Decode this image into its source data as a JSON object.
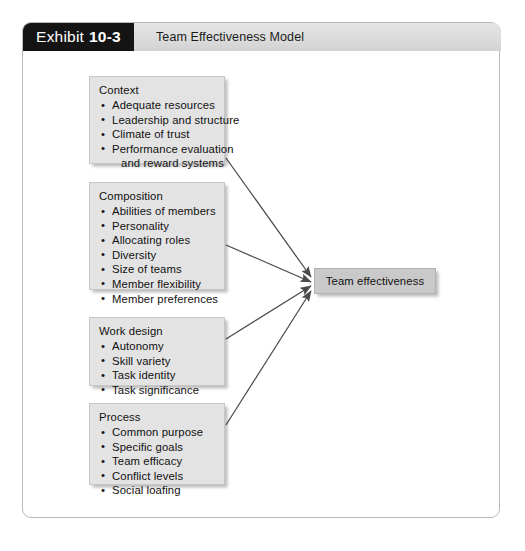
{
  "exhibit": {
    "tag_word": "Exhibit",
    "tag_number": "10-3",
    "title": "Team Effectiveness Model"
  },
  "colors": {
    "tag_background": "#141414",
    "title_bar_background": "#dcdcdc",
    "factor_box_background": "#e3e3e3",
    "outcome_box_background": "#c9c9c9",
    "arrow_stroke": "#4a4a4a",
    "frame_border": "#b9b9b9"
  },
  "diagram": {
    "type": "concept-model",
    "factors": [
      {
        "id": "context",
        "title": "Context",
        "items": [
          {
            "text": "Adequate resources",
            "continuation": false
          },
          {
            "text": "Leadership and structure",
            "continuation": false
          },
          {
            "text": "Climate of trust",
            "continuation": false
          },
          {
            "text": "Performance evaluation",
            "continuation": false
          },
          {
            "text": "and reward systems",
            "continuation": true
          }
        ]
      },
      {
        "id": "composition",
        "title": "Composition",
        "items": [
          {
            "text": "Abilities of members",
            "continuation": false
          },
          {
            "text": "Personality",
            "continuation": false
          },
          {
            "text": "Allocating roles",
            "continuation": false
          },
          {
            "text": "Diversity",
            "continuation": false
          },
          {
            "text": "Size of teams",
            "continuation": false
          },
          {
            "text": "Member flexibility",
            "continuation": false
          },
          {
            "text": "Member preferences",
            "continuation": false
          }
        ]
      },
      {
        "id": "work-design",
        "title": "Work design",
        "items": [
          {
            "text": "Autonomy",
            "continuation": false
          },
          {
            "text": "Skill variety",
            "continuation": false
          },
          {
            "text": "Task identity",
            "continuation": false
          },
          {
            "text": "Task significance",
            "continuation": false
          }
        ]
      },
      {
        "id": "process",
        "title": "Process",
        "items": [
          {
            "text": "Common purpose",
            "continuation": false
          },
          {
            "text": "Specific goals",
            "continuation": false
          },
          {
            "text": "Team efficacy",
            "continuation": false
          },
          {
            "text": "Conflict levels",
            "continuation": false
          },
          {
            "text": "Social loafing",
            "continuation": false
          }
        ]
      }
    ],
    "outcome": {
      "id": "team-effectiveness",
      "label": "Team effectiveness"
    },
    "arrows": [
      {
        "from": "context",
        "to": "team-effectiveness"
      },
      {
        "from": "composition",
        "to": "team-effectiveness"
      },
      {
        "from": "work-design",
        "to": "team-effectiveness"
      },
      {
        "from": "process",
        "to": "team-effectiveness"
      }
    ]
  },
  "layout": {
    "factor_boxes": [
      {
        "id": "context",
        "left": 66,
        "top": 25,
        "width": 136,
        "height": 88
      },
      {
        "id": "composition",
        "left": 66,
        "top": 131,
        "width": 136,
        "height": 108
      },
      {
        "id": "work-design",
        "left": 66,
        "top": 266,
        "width": 136,
        "height": 69
      },
      {
        "id": "process",
        "left": 66,
        "top": 352,
        "width": 136,
        "height": 82
      }
    ],
    "arrow_paths": [
      {
        "id": "arrow-context",
        "x1": 203,
        "y1": 107,
        "x2": 288,
        "y2": 226
      },
      {
        "id": "arrow-composition",
        "x1": 203,
        "y1": 194,
        "x2": 288,
        "y2": 231
      },
      {
        "id": "arrow-work-design",
        "x1": 203,
        "y1": 288,
        "x2": 288,
        "y2": 235
      },
      {
        "id": "arrow-process",
        "x1": 203,
        "y1": 374,
        "x2": 288,
        "y2": 240
      }
    ]
  }
}
